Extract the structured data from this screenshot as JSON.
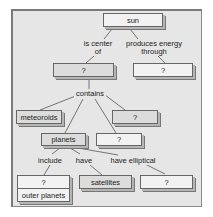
{
  "diagram": {
    "type": "concept-map",
    "nodes": {
      "sun": "sun",
      "q_center": "?",
      "q_energy": "?",
      "meteoroids": "meteoroids",
      "q_contains_right": "?",
      "planets": "planets",
      "q_contains_mid": "?",
      "q_include": "?",
      "outer_planets": "outer planets",
      "satellites": "satellites",
      "q_elliptical": "?"
    },
    "links": {
      "is_center_of_1": "is center",
      "is_center_of_2": "of",
      "produces_1": "produces energy",
      "produces_2": "through",
      "contains": "contains",
      "include": "include",
      "have": "have",
      "have_elliptical": "have elliptical"
    },
    "colors": {
      "background": "#e6e6e6",
      "box_fill": "#f2f2f2",
      "line": "#555555"
    }
  }
}
